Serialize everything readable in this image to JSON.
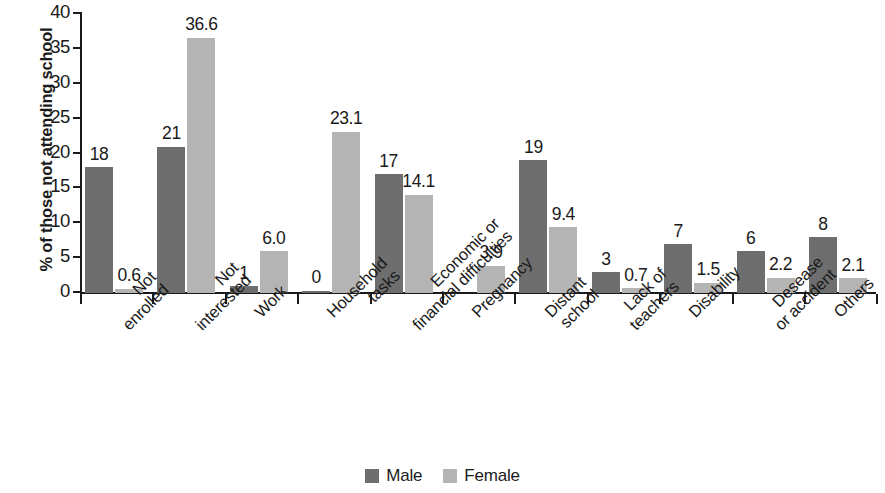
{
  "chart_data": {
    "type": "bar",
    "title": "",
    "xlabel": "",
    "ylabel": "% of those not attending school",
    "ylim": [
      0,
      40
    ],
    "yticks": [
      "0",
      "5",
      "10",
      "15",
      "20",
      "25",
      "30",
      "35",
      "40"
    ],
    "grid": false,
    "legend_position": "bottom-center",
    "categories": [
      "Not enrolled",
      "Not interested",
      "Work",
      "Household tasks",
      "Economic or financial difficulties",
      "Pregnancy",
      "Distant school",
      "Lack of teachers",
      "Disability",
      "Desease or accident",
      "Others"
    ],
    "category_lines": [
      [
        "Not",
        "enrolled"
      ],
      [
        "Not",
        "interested"
      ],
      [
        "Work"
      ],
      [
        "Household",
        "tasks"
      ],
      [
        "Economic or",
        "financial difficulties"
      ],
      [
        "Pregnancy"
      ],
      [
        "Distant",
        "school"
      ],
      [
        "Lack of",
        "teachers"
      ],
      [
        "Disability"
      ],
      [
        "Desease",
        "or accident"
      ],
      [
        "Others"
      ]
    ],
    "series": [
      {
        "name": "Male",
        "color": "#6e6e6e",
        "values": [
          18,
          21,
          1,
          0,
          17,
          null,
          19,
          3,
          7,
          6,
          8
        ],
        "labels": [
          "18",
          "21",
          "1",
          "0",
          "17",
          "",
          "19",
          "3",
          "7",
          "6",
          "8"
        ]
      },
      {
        "name": "Female",
        "color": "#b4b4b4",
        "values": [
          0.6,
          36.6,
          6.0,
          23.1,
          14.1,
          3.9,
          9.4,
          0.7,
          1.5,
          2.2,
          2.1
        ],
        "labels": [
          "0.6",
          "36.6",
          "6.0",
          "23.1",
          "14.1",
          "3.9",
          "9.4",
          "0.7",
          "1.5",
          "2.2",
          "2.1"
        ]
      }
    ]
  },
  "legend": {
    "entries": [
      {
        "label": "Male",
        "swatch": "male"
      },
      {
        "label": "Female",
        "swatch": "female"
      }
    ]
  }
}
